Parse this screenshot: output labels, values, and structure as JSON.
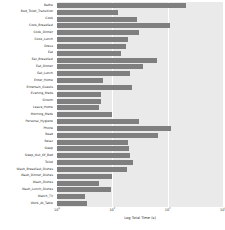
{
  "chart_data": {
    "type": "bar",
    "orientation": "horizontal",
    "title": "",
    "xlabel": "Log Total Time (s)",
    "ylabel": "",
    "xscale": "log",
    "xlim": [
      1,
      1000000
    ],
    "grid": true,
    "legend": null,
    "bar_color": "#7f7f7f",
    "plot_background": "#eaeaea",
    "xticks": [
      {
        "label": "10",
        "exp": "0",
        "value": 1
      },
      {
        "label": "10",
        "exp": "2",
        "value": 100
      },
      {
        "label": "10",
        "exp": "4",
        "value": 10000
      },
      {
        "label": "10",
        "exp": "6",
        "value": 1000000
      }
    ],
    "categories": [
      "Bathe",
      "Bed_Toilet_Transition",
      "Cook",
      "Cook_Breakfast",
      "Cook_Dinner",
      "Cook_Lunch",
      "Dress",
      "Eat",
      "Eat_Breakfast",
      "Eat_Dinner",
      "Eat_Lunch",
      "Enter_Home",
      "Entertain_Guests",
      "Evening_Meds",
      "Groom",
      "Leave_Home",
      "Morning_Meds",
      "Personal_Hygiene",
      "Phone",
      "Read",
      "Relax",
      "Sleep",
      "Sleep_Out_Of_Bed",
      "Toilet",
      "Wash_Breakfast_Dishes",
      "Wash_Dinner_Dishes",
      "Wash_Dishes",
      "Wash_Lunch_Dishes",
      "Watch_TV",
      "Work_At_Table"
    ],
    "values": [
      46000,
      160,
      800,
      12000,
      900,
      360,
      300,
      210,
      4200,
      1300,
      420,
      45,
      530,
      38,
      40,
      33,
      95,
      900,
      13000,
      4300,
      360,
      400,
      430,
      560,
      330,
      100,
      34,
      90,
      10,
      12
    ]
  }
}
